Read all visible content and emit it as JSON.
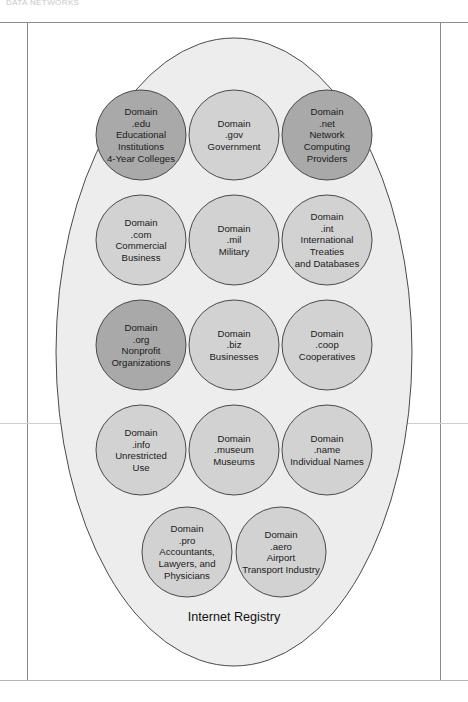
{
  "page": {
    "running_head": "DATA NETWORKS",
    "figure_caption": "Internet Registry"
  },
  "diagram": {
    "type": "venn-containment",
    "container_label": "Internet Registry",
    "container_shape": "ellipse",
    "node_shape": "circle",
    "node_count": 14,
    "colors": {
      "container_fill": "#ededed",
      "container_stroke": "#4a4a4a",
      "node_fill_light": "#d2d2d2",
      "node_fill_dark": "#a9a9a9",
      "node_stroke": "#4a4a4a",
      "text": "#1b1b1b",
      "rule": "#8d8d8d"
    },
    "rows": [
      {
        "row": 1,
        "nodes": [
          {
            "id": "edu",
            "shade": "dark",
            "lines": [
              "Domain",
              ".edu",
              "Educational",
              "Institutions",
              "4-Year Colleges"
            ]
          },
          {
            "id": "gov",
            "shade": "light",
            "lines": [
              "Domain",
              ".gov",
              "Government"
            ]
          },
          {
            "id": "net",
            "shade": "dark",
            "lines": [
              "Domain",
              ".net",
              "Network",
              "Computing",
              "Providers"
            ]
          }
        ]
      },
      {
        "row": 2,
        "nodes": [
          {
            "id": "com",
            "shade": "light",
            "lines": [
              "Domain",
              ".com",
              "Commercial",
              "Business"
            ]
          },
          {
            "id": "mil",
            "shade": "light",
            "lines": [
              "Domain",
              ".mil",
              "Military"
            ]
          },
          {
            "id": "int",
            "shade": "light",
            "lines": [
              "Domain",
              ".int",
              "International",
              "Treaties",
              "and Databases"
            ]
          }
        ]
      },
      {
        "row": 3,
        "nodes": [
          {
            "id": "org",
            "shade": "dark",
            "lines": [
              "Domain",
              ".org",
              "Nonprofit",
              "Organizations"
            ]
          },
          {
            "id": "biz",
            "shade": "light",
            "lines": [
              "Domain",
              ".biz",
              "Businesses"
            ]
          },
          {
            "id": "coop",
            "shade": "light",
            "lines": [
              "Domain",
              ".coop",
              "Cooperatives"
            ]
          }
        ]
      },
      {
        "row": 4,
        "nodes": [
          {
            "id": "info",
            "shade": "light",
            "lines": [
              "Domain",
              ".info",
              "Unrestricted",
              "Use"
            ]
          },
          {
            "id": "museum",
            "shade": "light",
            "lines": [
              "Domain",
              ".museum",
              "Museums"
            ]
          },
          {
            "id": "name",
            "shade": "light",
            "lines": [
              "Domain",
              ".name",
              "Individual Names"
            ]
          }
        ]
      },
      {
        "row": 5,
        "nodes": [
          {
            "id": "pro",
            "shade": "light",
            "lines": [
              "Domain",
              ".pro",
              "Accountants,",
              "Lawyers, and",
              "Physicians"
            ]
          },
          {
            "id": "aero",
            "shade": "light",
            "lines": [
              "Domain",
              ".aero",
              "Airport",
              "Transport Industry"
            ]
          }
        ]
      }
    ]
  }
}
